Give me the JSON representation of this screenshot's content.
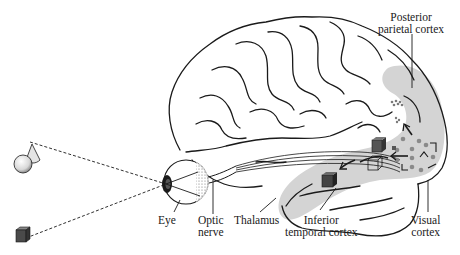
{
  "figure": {
    "type": "neuroanatomy-diagram"
  },
  "labels": {
    "posterior_parietal": [
      "Posterior",
      "parietal cortex"
    ],
    "eye": "Eye",
    "optic_nerve": [
      "Optic",
      "nerve"
    ],
    "thalamus": "Thalamus",
    "inferior_temporal": [
      "Inferior",
      "temporal cortex"
    ],
    "visual_cortex": [
      "Visual",
      "cortex"
    ]
  },
  "objects": [
    {
      "name": "sphere-and-cone",
      "position": "upper-left"
    },
    {
      "name": "cube",
      "position": "lower-left"
    }
  ],
  "colors": {
    "outline": "#1a1a1a",
    "shaded_region": "#d4d4d4",
    "cube_fill": "#4a4a4a",
    "dots": "#8a8a8a",
    "background": "#ffffff"
  }
}
